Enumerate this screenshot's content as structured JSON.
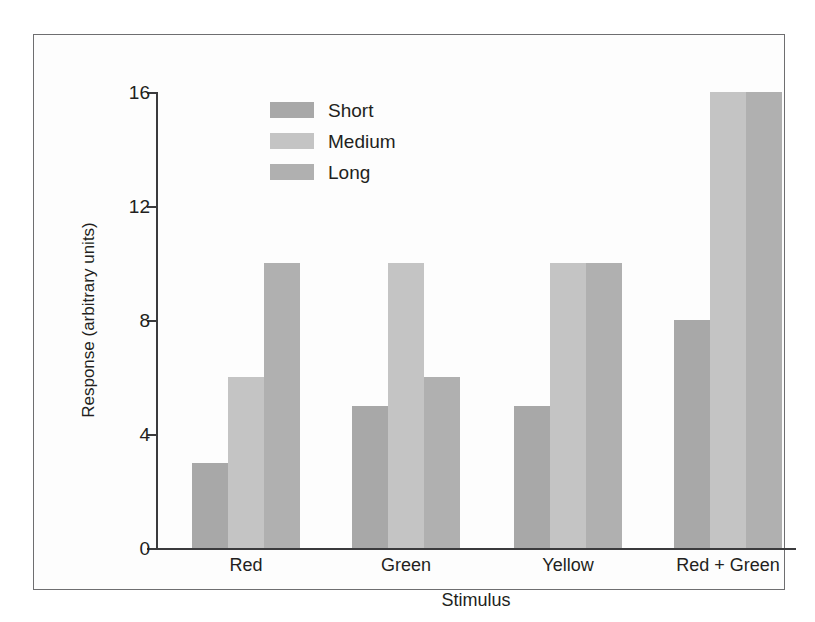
{
  "chart_data": {
    "type": "bar",
    "title": "",
    "subtitle": "",
    "xlabel": "Stimulus",
    "ylabel": "Response (arbitrary units)",
    "categories": [
      "Red",
      "Green",
      "Yellow",
      "Red + Green"
    ],
    "series": [
      {
        "name": "Short",
        "values": [
          3,
          5,
          5,
          8
        ],
        "color": "#a8a8a8"
      },
      {
        "name": "Medium",
        "values": [
          6,
          10,
          10,
          16
        ],
        "color": "#c4c4c4"
      },
      {
        "name": "Long",
        "values": [
          10,
          6,
          10,
          16
        ],
        "color": "#b0b0b0"
      }
    ],
    "yticks": [
      0,
      4,
      8,
      12,
      16
    ],
    "ytick_labels": [
      "0",
      "4",
      "8",
      "12",
      "16"
    ],
    "ylim": [
      0,
      16
    ],
    "grid": false,
    "legend_position": "upper-center-left",
    "legend_entries": [
      "Short",
      "Medium",
      "Long"
    ]
  },
  "axes": {
    "y_label": "Response (arbitrary units)",
    "x_label": "Stimulus"
  },
  "colors": {
    "axis": "#3b3b3d",
    "frame": "#6e6e70",
    "text": "#231f20",
    "background": "#ffffff"
  }
}
